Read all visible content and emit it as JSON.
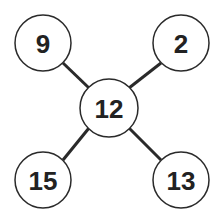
{
  "diagram": {
    "type": "star",
    "center": {
      "label": "12",
      "cx": 109,
      "cy": 108,
      "r": 29
    },
    "nodes": [
      {
        "id": "top-left",
        "label": "9",
        "cx": 43,
        "cy": 43,
        "r": 28
      },
      {
        "id": "top-right",
        "label": "2",
        "cx": 181,
        "cy": 43,
        "r": 28
      },
      {
        "id": "bottom-left",
        "label": "15",
        "cx": 43,
        "cy": 180,
        "r": 28
      },
      {
        "id": "bottom-right",
        "label": "13",
        "cx": 181,
        "cy": 180,
        "r": 28
      }
    ],
    "colors": {
      "stroke": "#2a2a2a",
      "text": "#222222",
      "fill": "#ffffff"
    }
  }
}
